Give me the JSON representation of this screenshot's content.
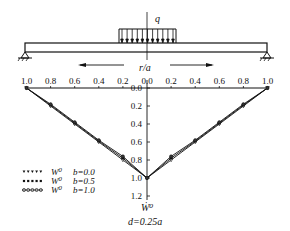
{
  "diagram": {
    "load_label": "q",
    "axis_label": "r/a",
    "y_axis_label": "Ẇ⁰",
    "caption": "d=0.25a",
    "x_ticks_left": [
      "1.0",
      "0.8",
      "0.6",
      "0.4",
      "0.2"
    ],
    "x_tick_center": "0.0",
    "x_ticks_right": [
      "0.2",
      "0.4",
      "0.6",
      "0.8",
      "1.0"
    ],
    "y_ticks": [
      "0.0",
      "0.2",
      "0.4",
      "0.6",
      "0.8",
      "1.0",
      "1.2"
    ],
    "legend": [
      {
        "symbol": "W⁰",
        "label": "b=0.0",
        "marker": "triangle"
      },
      {
        "symbol": "W⁰",
        "label": "b=0.5",
        "marker": "square"
      },
      {
        "symbol": "W⁰",
        "label": "b=1.0",
        "marker": "circle"
      }
    ]
  },
  "chart_data": {
    "type": "line",
    "title": "",
    "xlabel": "r/a",
    "ylabel": "Ẇ⁰",
    "annotation": "d=0.25a",
    "x": [
      -1.0,
      -0.8,
      -0.6,
      -0.4,
      -0.2,
      0.0,
      0.2,
      0.4,
      0.6,
      0.8,
      1.0
    ],
    "xlim": [
      -1.0,
      1.0
    ],
    "ylim": [
      0.0,
      1.2
    ],
    "y_inverted": true,
    "series": [
      {
        "name": "W⁰ b=0.0",
        "values": [
          0.0,
          0.2,
          0.4,
          0.6,
          0.8,
          1.0,
          0.8,
          0.6,
          0.4,
          0.2,
          0.0
        ]
      },
      {
        "name": "W⁰ b=0.5",
        "values": [
          0.0,
          0.19,
          0.39,
          0.59,
          0.78,
          1.0,
          0.78,
          0.59,
          0.39,
          0.19,
          0.0
        ]
      },
      {
        "name": "W⁰ b=1.0",
        "values": [
          0.0,
          0.18,
          0.38,
          0.58,
          0.76,
          1.0,
          0.76,
          0.58,
          0.38,
          0.18,
          0.0
        ]
      }
    ]
  }
}
